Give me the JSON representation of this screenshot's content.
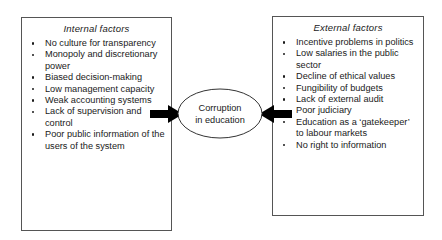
{
  "diagram": {
    "center": {
      "label_line1": "Corruption",
      "label_line2": "in education",
      "shape": "ellipse"
    },
    "left_box": {
      "title": "Internal  factors",
      "items": [
        "No culture for transparency",
        "Monopoly and discretionary power",
        "Biased decision-making",
        "Low management capacity",
        "Weak accounting systems",
        "Lack of supervision and control",
        "Poor public information of the users of the system"
      ]
    },
    "right_box": {
      "title": "External factors",
      "items": [
        "Incentive problems in politics",
        "Low salaries in the public sector",
        "Decline of ethical values",
        "Fungibility of budgets",
        "Lack of external audit",
        "Poor judiciary",
        "Education as a ‘gatekeeper’ to labour markets",
        "No right to information"
      ]
    },
    "arrows": [
      {
        "name": "arrow-internal-to-center",
        "direction": "right"
      },
      {
        "name": "arrow-external-to-center",
        "direction": "left"
      }
    ],
    "colors": {
      "arrow": "#000000",
      "box_border": "#555555",
      "ellipse_stroke": "#333333",
      "text": "#1a1a1a",
      "background": "#ffffff"
    }
  }
}
